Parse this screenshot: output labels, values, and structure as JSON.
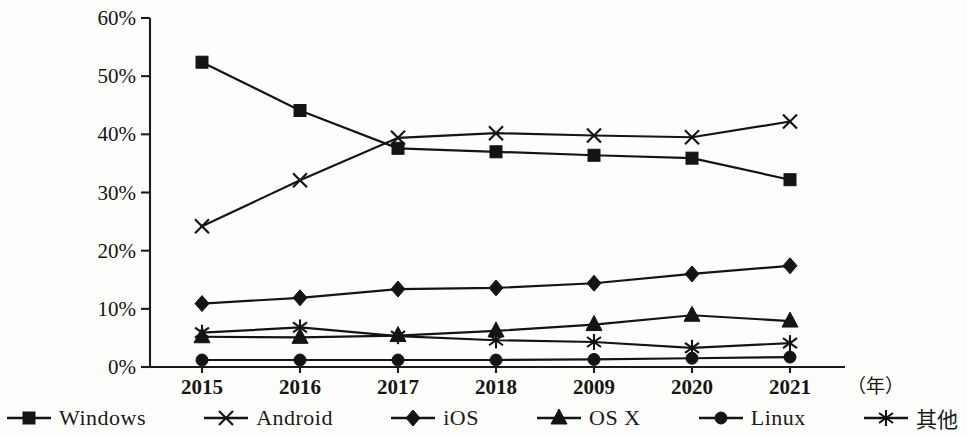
{
  "chart_data": {
    "type": "line",
    "title": "",
    "xlabel": "年",
    "ylabel": "",
    "ylim": [
      0,
      60
    ],
    "ytick_labels": [
      "0%",
      "10%",
      "20%",
      "30%",
      "40%",
      "50%",
      "60%"
    ],
    "ytick_values": [
      0,
      10,
      20,
      30,
      40,
      50,
      60
    ],
    "grid": false,
    "legend_position": "bottom",
    "categories": [
      "2015",
      "2016",
      "2017",
      "2018",
      "2009",
      "2020",
      "2021"
    ],
    "series": [
      {
        "name": "Windows",
        "marker": "square",
        "values": [
          52.4,
          44.1,
          37.6,
          37.0,
          36.4,
          35.9,
          32.2
        ]
      },
      {
        "name": "Android",
        "marker": "x",
        "values": [
          24.2,
          32.1,
          39.4,
          40.2,
          39.8,
          39.5,
          42.2
        ]
      },
      {
        "name": "iOS",
        "marker": "diamond",
        "values": [
          10.9,
          11.9,
          13.4,
          13.6,
          14.4,
          16.0,
          17.4
        ]
      },
      {
        "name": "OS X",
        "marker": "triangle",
        "values": [
          5.2,
          5.1,
          5.4,
          6.2,
          7.3,
          8.9,
          7.9
        ]
      },
      {
        "name": "Linux",
        "marker": "circle",
        "values": [
          1.2,
          1.2,
          1.2,
          1.2,
          1.3,
          1.5,
          1.7
        ]
      },
      {
        "name": "其他",
        "marker": "asterisk",
        "values": [
          5.9,
          6.8,
          5.3,
          4.6,
          4.3,
          3.3,
          4.1
        ]
      }
    ]
  },
  "axis": {
    "unit_label": "（年）"
  },
  "legend": {
    "items": [
      {
        "label": "Windows",
        "marker": "square"
      },
      {
        "label": "Android",
        "marker": "x"
      },
      {
        "label": "iOS",
        "marker": "diamond"
      },
      {
        "label": "OS X",
        "marker": "triangle"
      },
      {
        "label": "Linux",
        "marker": "circle"
      },
      {
        "label": "其他",
        "marker": "asterisk"
      }
    ]
  }
}
